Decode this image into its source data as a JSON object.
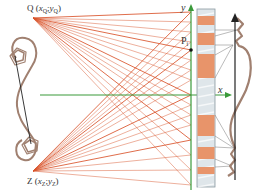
{
  "diagram": {
    "type": "optical/projection geometry diagram",
    "labels": {
      "q_name": "Q",
      "q_coord_open": "(",
      "q_x": "x",
      "q_x_sub": "Q",
      "q_sep": ";",
      "q_y": "y",
      "q_y_sub": "Q",
      "q_coord_close": ")",
      "z_name": "Z",
      "z_coord_open": "(",
      "z_x": "x",
      "z_x_sub": "Z",
      "z_sep": ";",
      "z_y": "y",
      "z_y_sub": "Z",
      "z_coord_close": ")",
      "y_axis": "y",
      "x_axis": "x",
      "p_name": "P",
      "p_sub": "i"
    },
    "points": {
      "Q": [
        33,
        18
      ],
      "Z": [
        33,
        171
      ],
      "P": [
        193,
        50
      ]
    },
    "axes": {
      "y_axis_x": 191,
      "x_axis_y": 95,
      "color": "#3a9a3a"
    },
    "strip": {
      "x": 197,
      "y": 9,
      "width": 18,
      "height": 178,
      "base_color": "#dfe6ea",
      "orange_color": "#e8946a",
      "orange_segments": [
        [
          16,
          25
        ],
        [
          33,
          45
        ],
        [
          54,
          78
        ],
        [
          115,
          136
        ],
        [
          147,
          159
        ],
        [
          167,
          174
        ]
      ]
    },
    "rays": {
      "color": "#d9542b",
      "target_ys": [
        12,
        22,
        32,
        42,
        50,
        60,
        70,
        80,
        95,
        105,
        115,
        125,
        140,
        155,
        170,
        185
      ]
    },
    "colors": {
      "ray": "#d9542b",
      "axis": "#3a9a3a",
      "curve": "#a08070",
      "dark_line": "#222222"
    }
  }
}
